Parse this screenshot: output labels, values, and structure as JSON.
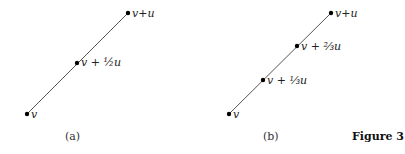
{
  "figure": {
    "title": "Figure 3",
    "panels": [
      {
        "caption": "(a)",
        "segment": {
          "from": [
            27,
            114
          ],
          "to": [
            128,
            13
          ]
        },
        "points": [
          {
            "label": "v",
            "xy": [
              27,
              114
            ]
          },
          {
            "label": "v + ½u",
            "xy": [
              77,
              63
            ]
          },
          {
            "label": "v+u",
            "xy": [
              128,
              13
            ]
          }
        ]
      },
      {
        "caption": "(b)",
        "segment": {
          "from": [
            229,
            114
          ],
          "to": [
            331,
            13
          ]
        },
        "points": [
          {
            "label": "v",
            "xy": [
              229,
              114
            ]
          },
          {
            "label": "v + ⅓u",
            "xy": [
              263,
              80
            ]
          },
          {
            "label": "v + ⅔u",
            "xy": [
              297,
              46
            ]
          },
          {
            "label": "v+u",
            "xy": [
              331,
              13
            ]
          }
        ]
      }
    ]
  },
  "colors": {
    "line": "#555555",
    "point": "#000000"
  }
}
